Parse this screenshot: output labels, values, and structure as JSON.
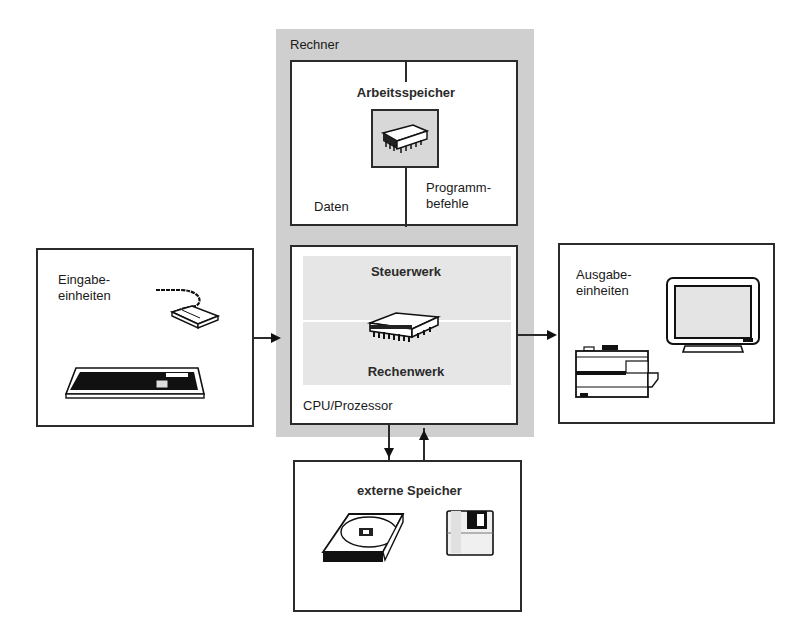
{
  "diagram": {
    "title": "Rechner",
    "memory": {
      "label": "Arbeitsspeicher",
      "left_label": "Daten",
      "right_label": "Programm-\nbefehle",
      "icon": "memory-chip-icon"
    },
    "cpu": {
      "label": "CPU/Prozessor",
      "control_unit": "Steuerwerk",
      "alu": "Rechenwerk",
      "icon": "cpu-chip-icon"
    },
    "input": {
      "label": "Eingabe-\neinheiten",
      "icons": [
        "mouse-icon",
        "keyboard-icon"
      ]
    },
    "output": {
      "label": "Ausgabe-\neinheiten",
      "icons": [
        "monitor-icon",
        "printer-icon"
      ]
    },
    "storage": {
      "label": "externe Speicher",
      "icons": [
        "hard-disk-icon",
        "floppy-disk-icon"
      ]
    },
    "connections": [
      {
        "from": "input",
        "to": "cpu"
      },
      {
        "from": "cpu",
        "to": "output"
      },
      {
        "from": "cpu",
        "to": "storage"
      },
      {
        "from": "storage",
        "to": "cpu"
      }
    ],
    "colors": {
      "panel_gray": "#cfcfcf",
      "inner_gray": "#e6e6e6",
      "line": "#2b2b2b"
    }
  }
}
